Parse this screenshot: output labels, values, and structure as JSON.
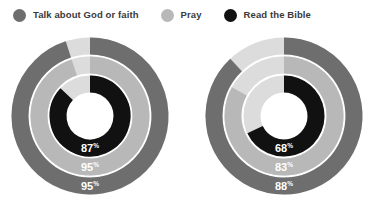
{
  "legend": {
    "items": [
      {
        "label": "Talk about God or faith",
        "color": "#6e6e6e",
        "icon": "circle-marker-icon"
      },
      {
        "label": "Pray",
        "color": "#b8b8b8",
        "icon": "circle-marker-icon"
      },
      {
        "label": "Read the Bible",
        "color": "#111111",
        "icon": "circle-marker-icon"
      }
    ]
  },
  "colors": {
    "talk": "#6e6e6e",
    "pray": "#b8b8b8",
    "bible": "#111111",
    "track": "#dcdcdc",
    "background": "#ffffff",
    "label_text": "#ffffff",
    "legend_text": "#3a3a3a"
  },
  "chart_data": {
    "type": "pie",
    "title": "",
    "subtitle": "",
    "xlabel": "",
    "ylabel": "",
    "legend_position": "top-left",
    "grid": false,
    "variant": "concentric-radial-progress",
    "start_angle_deg": 0,
    "direction": "clockwise",
    "units": "%",
    "categories": [
      "Talk about God or faith",
      "Pray",
      "Read the Bible"
    ],
    "charts": [
      {
        "name": "chart-left",
        "rings": [
          {
            "name": "Talk about God or faith",
            "value": 95,
            "label": "95",
            "pct": "%",
            "color": "#6e6e6e"
          },
          {
            "name": "Pray",
            "value": 95,
            "label": "95",
            "pct": "%",
            "color": "#b8b8b8"
          },
          {
            "name": "Read the Bible",
            "value": 87,
            "label": "87",
            "pct": "%",
            "color": "#111111"
          }
        ]
      },
      {
        "name": "chart-right",
        "rings": [
          {
            "name": "Talk about God or faith",
            "value": 88,
            "label": "88",
            "pct": "%",
            "color": "#6e6e6e"
          },
          {
            "name": "Pray",
            "value": 83,
            "label": "83",
            "pct": "%",
            "color": "#b8b8b8"
          },
          {
            "name": "Read the Bible",
            "value": 68,
            "label": "68",
            "pct": "%",
            "color": "#111111"
          }
        ]
      }
    ]
  }
}
